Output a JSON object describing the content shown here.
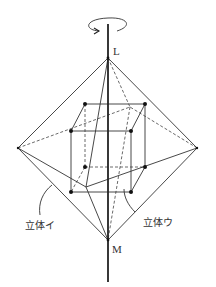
{
  "diagram": {
    "type": "solid-of-rotation",
    "labels": {
      "top_point": "L",
      "bottom_point": "M",
      "solid_i": "立体イ",
      "solid_u": "立体ウ"
    },
    "rotation_indicator": "rotation-arrow",
    "colors": {
      "line": "#333333",
      "background": "#ffffff"
    }
  }
}
